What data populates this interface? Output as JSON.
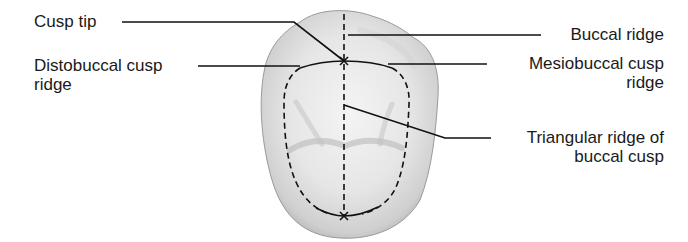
{
  "diagram": {
    "colors": {
      "text": "#1a1a1a",
      "line": "#111111",
      "tooth_fill_light": "#f2f2f2",
      "tooth_fill_dark": "#a9a9a9",
      "background": "#ffffff"
    },
    "labels": {
      "cusp_tip": {
        "line1": "Cusp tip"
      },
      "distobuccal_cusp_ridge": {
        "line1": "Distobuccal cusp",
        "line2": "ridge"
      },
      "buccal_ridge": {
        "line1": "Buccal ridge"
      },
      "mesiobuccal_cusp_ridge": {
        "line1": "Mesiobuccal cusp",
        "line2": "ridge"
      },
      "triangular_ridge": {
        "line1": "Triangular ridge of",
        "line2": "buccal cusp"
      }
    },
    "markers": [
      {
        "name": "cusp-tip-marker",
        "symbol": "x",
        "x": 344,
        "y": 61
      },
      {
        "name": "bottom-marker",
        "symbol": "x",
        "x": 344,
        "y": 216
      }
    ]
  }
}
